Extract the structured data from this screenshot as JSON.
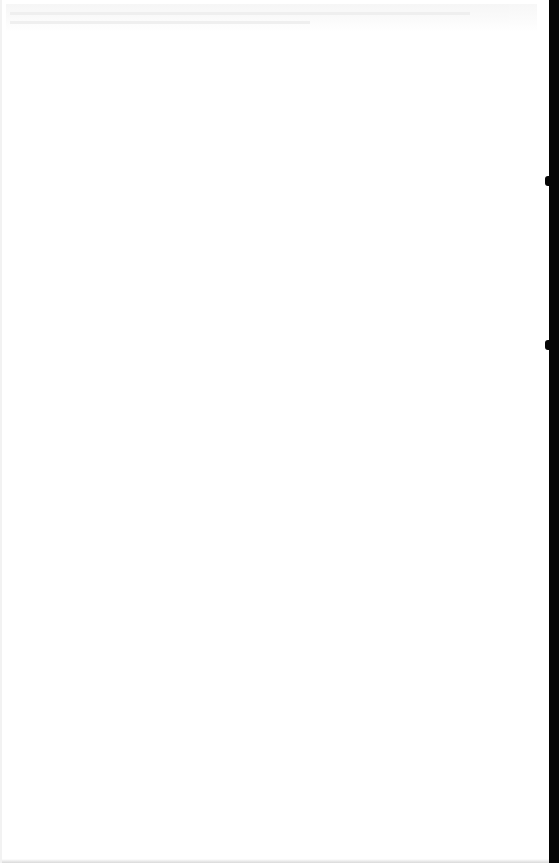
{
  "page": {
    "background": "#ffffff",
    "content_legible": false
  },
  "header": {
    "text": ""
  },
  "edges": {
    "right_strip_color": "#050505",
    "notches_y": [
      176,
      340
    ]
  }
}
